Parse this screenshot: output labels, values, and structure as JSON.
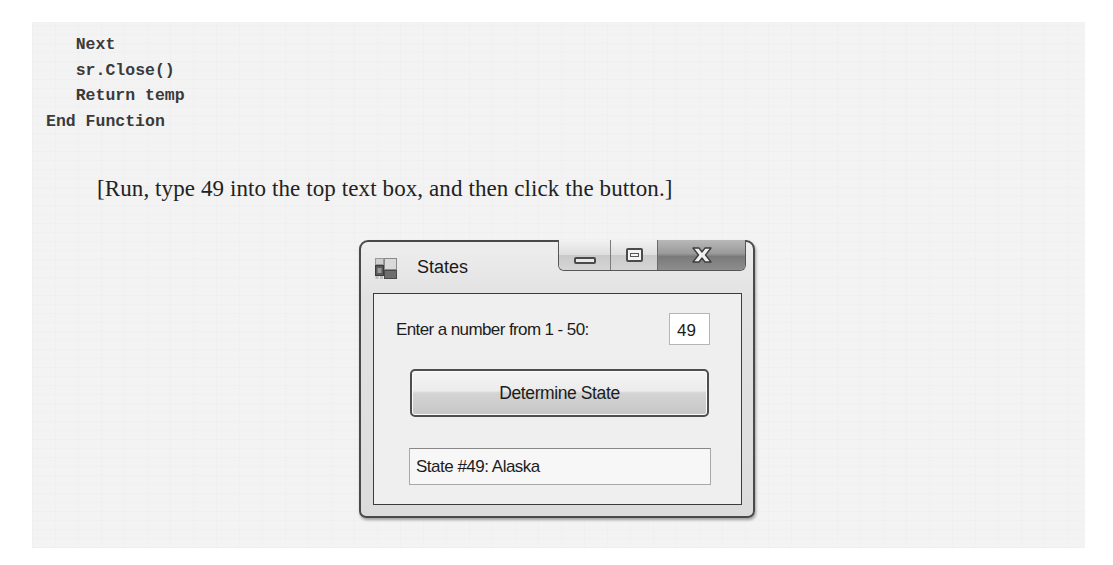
{
  "code": {
    "lines": [
      {
        "indent": "   ",
        "text": "Next"
      },
      {
        "indent": "   ",
        "text": "sr.Close()"
      },
      {
        "indent": "   ",
        "text": "Return temp"
      },
      {
        "indent": "",
        "text": "End Function"
      }
    ]
  },
  "instruction": "[Run, type 49 into the top text box, and then click the button.]",
  "window": {
    "title": "States",
    "icon": "form-app-icon",
    "caption_buttons": {
      "minimize": "minimize-icon",
      "maximize": "maximize-icon",
      "close": "close-icon"
    },
    "form": {
      "prompt_label": "Enter a number from 1 - 50:",
      "number_input_value": "49",
      "determine_button_label": "Determine State",
      "result_text": "State #49: Alaska"
    }
  }
}
